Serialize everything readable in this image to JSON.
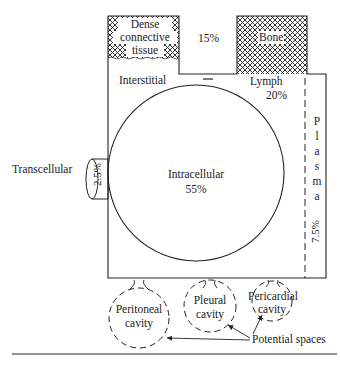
{
  "diagram": {
    "compartments": {
      "dense_connective": {
        "line1": "Dense",
        "line2": "connective",
        "line3": "tissue"
      },
      "middle_pct": "15%",
      "bone": "Bone",
      "interstitial": "Interstitial",
      "lymph": {
        "label": "Lymph",
        "pct": "20%"
      },
      "intracellular": {
        "label": "Intracellular",
        "pct": "55%"
      },
      "transcellular": {
        "label": "Transcellular",
        "pct": "2.5%"
      },
      "plasma": {
        "letters": [
          "P",
          "l",
          "a",
          "s",
          "m",
          "a"
        ],
        "pct": "7.5%"
      }
    },
    "cavities": {
      "peritoneal": {
        "line1": "Peritoneal",
        "line2": "cavity"
      },
      "pleural": {
        "line1": "Pleural",
        "line2": "cavity"
      },
      "pericardial": {
        "line1": "Pericardial",
        "line2": "cavity"
      }
    },
    "annotation": "Potential spaces",
    "colors": {
      "line": "#222222",
      "background": "#ffffff"
    }
  }
}
